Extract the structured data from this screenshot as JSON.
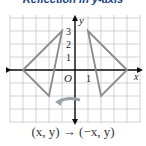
{
  "title": "Reflection in y-axis",
  "axes": {
    "x_label": "x",
    "y_label": "y",
    "origin_label": "O",
    "x_tick": "1",
    "y_ticks": [
      "1",
      "2",
      "3"
    ]
  },
  "figures": {
    "original": {
      "points": [
        [
          -4,
          0
        ],
        [
          -1,
          3
        ],
        [
          -2,
          -2
        ]
      ]
    },
    "reflected": {
      "points": [
        [
          4,
          0
        ],
        [
          1,
          3
        ],
        [
          2,
          -2
        ]
      ]
    }
  },
  "rule": "(x, y) → (−x, y)",
  "colors": {
    "triangle": "#8a8a8a",
    "grid": "#c8c8c8",
    "axis": "#111111",
    "arrow": "#9a9a9a"
  }
}
